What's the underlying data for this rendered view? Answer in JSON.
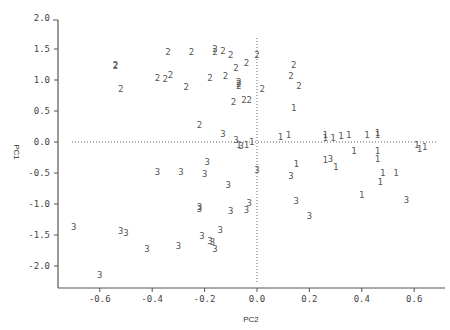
{
  "chart_data": {
    "type": "scatter",
    "title": "",
    "xlabel": "PC2",
    "ylabel": "PC1",
    "xlim": [
      -0.76,
      0.68
    ],
    "ylim": [
      -2.3,
      2.0
    ],
    "x_ticks": [
      -0.6,
      -0.4,
      -0.2,
      0.0,
      0.2,
      0.4,
      0.6
    ],
    "x_tick_labels": [
      "-0.6",
      "-0.4",
      "-0.2",
      "0.0",
      "0.2",
      "0.4",
      "0.6"
    ],
    "y_ticks": [
      2.0,
      1.5,
      1.0,
      0.5,
      0.0,
      -0.5,
      -1.0,
      -1.5,
      -2.0
    ],
    "y_tick_labels": [
      "2.0",
      "1.5",
      "1.0",
      "0.5",
      "0.0",
      "-0.5",
      "-1.0",
      "-1.5",
      "-2.0"
    ],
    "reference_lines": {
      "x": 0.0,
      "y": 0.0,
      "style": "dotted"
    },
    "grid": false,
    "legend": null,
    "marker_style": "text-labels (group number)",
    "series": [
      {
        "name": "1",
        "points": [
          [
            0.09,
            0.08
          ],
          [
            0.12,
            0.11
          ],
          [
            0.26,
            0.12
          ],
          [
            0.29,
            0.07
          ],
          [
            0.32,
            0.09
          ],
          [
            0.35,
            0.12
          ],
          [
            0.42,
            0.12
          ],
          [
            0.46,
            0.11
          ],
          [
            0.46,
            0.14
          ],
          [
            0.26,
            0.07
          ],
          [
            0.61,
            -0.05
          ],
          [
            0.62,
            -0.12
          ],
          [
            0.64,
            -0.08
          ],
          [
            0.37,
            -0.15
          ],
          [
            0.46,
            -0.15
          ],
          [
            0.46,
            -0.28
          ],
          [
            0.15,
            -0.35
          ],
          [
            0.3,
            -0.4
          ],
          [
            0.48,
            -0.5
          ],
          [
            0.53,
            -0.5
          ],
          [
            0.47,
            -0.64
          ],
          [
            0.4,
            -0.85
          ],
          [
            -0.07,
            -0.05
          ],
          [
            -0.04,
            -0.05
          ],
          [
            -0.02,
            0.0
          ],
          [
            0.14,
            0.55
          ],
          [
            0.26,
            -0.29
          ]
        ]
      },
      {
        "name": "2",
        "points": [
          [
            -0.54,
            1.25
          ],
          [
            -0.54,
            1.22
          ],
          [
            -0.52,
            0.85
          ],
          [
            -0.34,
            1.45
          ],
          [
            -0.33,
            1.08
          ],
          [
            -0.35,
            1.02
          ],
          [
            -0.27,
            0.88
          ],
          [
            -0.25,
            1.45
          ],
          [
            -0.18,
            1.03
          ],
          [
            -0.16,
            1.5
          ],
          [
            -0.16,
            1.45
          ],
          [
            -0.1,
            1.4
          ],
          [
            -0.12,
            1.07
          ],
          [
            -0.08,
            1.2
          ],
          [
            -0.04,
            1.28
          ],
          [
            -0.07,
            0.97
          ],
          [
            -0.07,
            0.94
          ],
          [
            -0.07,
            0.9
          ],
          [
            -0.09,
            0.65
          ],
          [
            -0.05,
            0.68
          ],
          [
            -0.03,
            0.68
          ],
          [
            0.0,
            1.4
          ],
          [
            0.02,
            0.85
          ],
          [
            0.14,
            1.25
          ],
          [
            0.13,
            1.07
          ],
          [
            0.16,
            0.9
          ],
          [
            -0.22,
            0.28
          ],
          [
            -0.38,
            1.03
          ],
          [
            -0.13,
            1.47
          ]
        ]
      },
      {
        "name": "3",
        "points": [
          [
            -0.7,
            -1.37
          ],
          [
            -0.52,
            -1.43
          ],
          [
            -0.5,
            -1.47
          ],
          [
            -0.42,
            -1.73
          ],
          [
            -0.6,
            -2.15
          ],
          [
            -0.38,
            -0.48
          ],
          [
            -0.29,
            -0.48
          ],
          [
            -0.22,
            -1.05
          ],
          [
            -0.22,
            -1.08
          ],
          [
            -0.21,
            -1.52
          ],
          [
            -0.3,
            -1.68
          ],
          [
            -0.18,
            -1.6
          ],
          [
            -0.16,
            -1.73
          ],
          [
            -0.17,
            -1.62
          ],
          [
            -0.14,
            -1.42
          ],
          [
            -0.19,
            -0.33
          ],
          [
            -0.2,
            -0.52
          ],
          [
            -0.11,
            -0.7
          ],
          [
            -0.1,
            -1.12
          ],
          [
            -0.04,
            -1.1
          ],
          [
            -0.03,
            -0.98
          ],
          [
            0.0,
            -0.45
          ],
          [
            0.13,
            -0.55
          ],
          [
            0.15,
            -0.95
          ],
          [
            0.2,
            -1.2
          ],
          [
            0.28,
            -0.28
          ],
          [
            0.57,
            -0.93
          ],
          [
            -0.13,
            0.13
          ],
          [
            -0.06,
            -0.07
          ],
          [
            -0.08,
            0.03
          ]
        ]
      }
    ]
  }
}
